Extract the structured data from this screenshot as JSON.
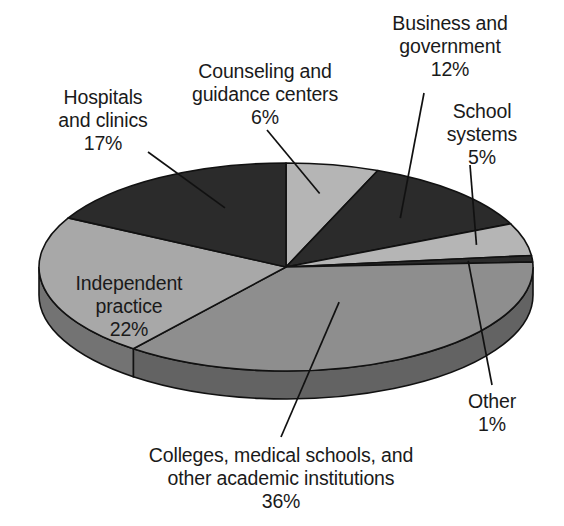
{
  "chart_data": {
    "type": "pie",
    "title": "",
    "subtitle": "",
    "xlabel": "",
    "ylabel": "",
    "grid": false,
    "legend_position": "none",
    "style": "3d-exploded-none",
    "units": "percent",
    "categories": [
      "Counseling and guidance centers",
      "Business and government",
      "School systems",
      "Other",
      "Colleges, medical schools, and other academic institutions",
      "Independent practice",
      "Hospitals and clinics"
    ],
    "values": [
      6,
      12,
      5,
      1,
      36,
      22,
      17
    ],
    "slices": [
      {
        "id": "counseling",
        "label": "Counseling and\nguidance centers",
        "percent_text": "6%",
        "value": 6,
        "color": "#b5b5b5",
        "side_color": "#7d7d7d",
        "label_placement": "outside-top",
        "leader_line": true
      },
      {
        "id": "business-government",
        "label": "Business and\ngovernment",
        "percent_text": "12%",
        "value": 12,
        "color": "#2b2b2b",
        "side_color": "#1d1d1d",
        "label_placement": "outside-top-right",
        "leader_line": true
      },
      {
        "id": "school-systems",
        "label": "School\nsystems",
        "percent_text": "5%",
        "value": 5,
        "color": "#b5b5b5",
        "side_color": "#7d7d7d",
        "label_placement": "outside-right",
        "leader_line": true
      },
      {
        "id": "other",
        "label": "Other",
        "percent_text": "1%",
        "value": 1,
        "color": "#2b2b2b",
        "side_color": "#1d1d1d",
        "label_placement": "outside-bottom-right",
        "leader_line": true
      },
      {
        "id": "colleges",
        "label": "Colleges, medical schools, and\nother academic institutions",
        "percent_text": "36%",
        "value": 36,
        "color": "#8e8e8e",
        "side_color": "#636363",
        "label_placement": "outside-bottom",
        "leader_line": true
      },
      {
        "id": "independent-practice",
        "label": "Independent\npractice",
        "percent_text": "22%",
        "value": 22,
        "color": "#a8a8a8",
        "side_color": "#737373",
        "label_placement": "inside",
        "leader_line": false
      },
      {
        "id": "hospitals-clinics",
        "label": "Hospitals\nand clinics",
        "percent_text": "17%",
        "value": 17,
        "color": "#2b2b2b",
        "side_color": "#1d1d1d",
        "label_placement": "outside-top-left",
        "leader_line": true
      }
    ],
    "colors": {
      "dark": "#2b2b2b",
      "light_gray": "#b5b5b5",
      "medium_gray": "#8e8e8e",
      "mid_light_gray": "#a8a8a8",
      "side_wall": "#6e6e6e",
      "outline": "#111111",
      "background": "#ffffff",
      "text": "#1a1a1a"
    }
  },
  "labels": {
    "hospitals": "Hospitals\nand clinics\n17%",
    "counseling": "Counseling and\nguidance centers\n6%",
    "business": "Business and\ngovernment\n12%",
    "school": "School\nsystems\n5%",
    "other": "Other\n1%",
    "colleges": "Colleges, medical schools, and\nother academic institutions\n36%",
    "independent": "Independent\npractice\n22%"
  }
}
